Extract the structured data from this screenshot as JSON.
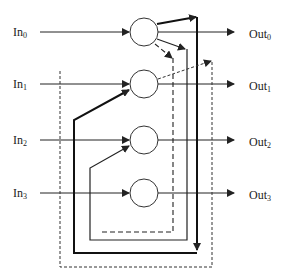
{
  "diagram": {
    "inputs": [
      {
        "base": "In",
        "sub": "0"
      },
      {
        "base": "In",
        "sub": "1"
      },
      {
        "base": "In",
        "sub": "2"
      },
      {
        "base": "In",
        "sub": "3"
      }
    ],
    "outputs": [
      {
        "base": "Out",
        "sub": "0"
      },
      {
        "base": "Out",
        "sub": "1"
      },
      {
        "base": "Out",
        "sub": "2"
      },
      {
        "base": "Out",
        "sub": "3"
      }
    ],
    "nodes": 4,
    "colors": {
      "line": "#222222",
      "background": "#ffffff"
    }
  }
}
